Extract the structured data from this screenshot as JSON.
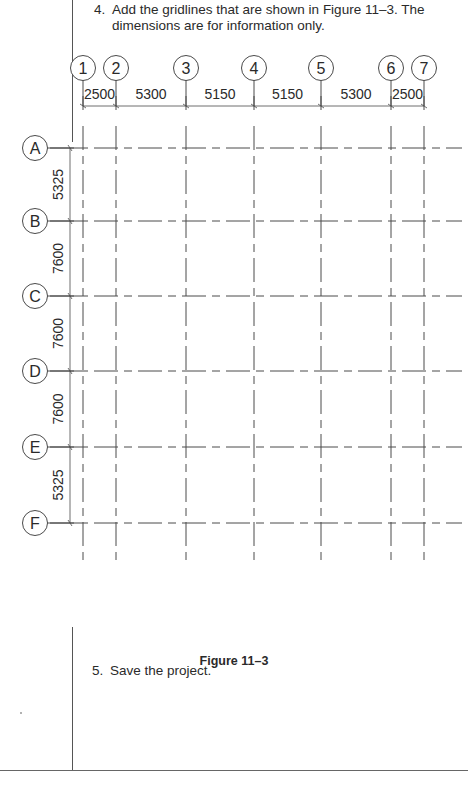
{
  "instructions": {
    "step4": {
      "number": "4.",
      "line1": "Add the gridlines that are shown in Figure 11–3. The",
      "line2": "dimensions are for information only."
    },
    "step5": {
      "number": "5.",
      "text": "Save the project."
    }
  },
  "figure": {
    "caption": "Figure 11–3",
    "column_grids": [
      {
        "label": "1",
        "x": 83
      },
      {
        "label": "2",
        "x": 116
      },
      {
        "label": "3",
        "x": 186
      },
      {
        "label": "4",
        "x": 254
      },
      {
        "label": "5",
        "x": 321
      },
      {
        "label": "6",
        "x": 391
      },
      {
        "label": "7",
        "x": 424
      }
    ],
    "column_dimensions": [
      "2500",
      "5300",
      "5150",
      "5150",
      "5300",
      "2500"
    ],
    "row_grids": [
      {
        "label": "A",
        "y": 148
      },
      {
        "label": "B",
        "y": 221
      },
      {
        "label": "C",
        "y": 296
      },
      {
        "label": "D",
        "y": 371
      },
      {
        "label": "E",
        "y": 447
      },
      {
        "label": "F",
        "y": 523
      }
    ],
    "row_dimensions": [
      "5325",
      "7600",
      "7600",
      "7600",
      "5325"
    ],
    "line_color": "#4a4a4a"
  }
}
